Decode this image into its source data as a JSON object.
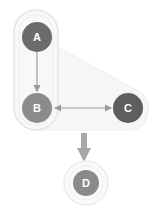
{
  "diagram": {
    "nodes": [
      {
        "id": "A",
        "label": "A",
        "color": "#6b6b6b"
      },
      {
        "id": "B",
        "label": "B",
        "color": "#8c8c8c"
      },
      {
        "id": "C",
        "label": "C",
        "color": "#5e5e5e"
      },
      {
        "id": "D",
        "label": "D",
        "color": "#8a8a8a"
      }
    ],
    "edges": [
      {
        "from": "A",
        "to": "B",
        "type": "directed"
      },
      {
        "from": "B",
        "to": "C",
        "type": "bidirectional"
      },
      {
        "from": "group",
        "to": "D",
        "type": "directed-thick"
      }
    ],
    "group": {
      "members": [
        "A",
        "B",
        "C"
      ]
    }
  }
}
